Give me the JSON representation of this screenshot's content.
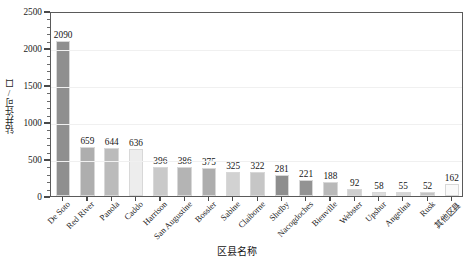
{
  "chart_data": {
    "type": "bar",
    "title": "",
    "xlabel": "区县名称",
    "ylabel": "钻井许可/口",
    "ylim": [
      0,
      2500
    ],
    "yticks": [
      0,
      500,
      1000,
      1500,
      2000,
      2500
    ],
    "grid": true,
    "legend": "none",
    "categories": [
      "De Soto",
      "Red River",
      "Panola",
      "Caddo",
      "Harrison",
      "San Augustine",
      "Bossier",
      "Sabine",
      "Claiborne",
      "Shelby",
      "Nacogdoches",
      "Bienville",
      "Webster",
      "Upshur",
      "Angelina",
      "Rusk",
      "其他区县"
    ],
    "values": [
      2090,
      659,
      644,
      636,
      396,
      386,
      375,
      325,
      322,
      281,
      221,
      188,
      92,
      58,
      55,
      52,
      162
    ],
    "bar_colors": [
      "#8f8f8f",
      "#aeaeae",
      "#bbbbbb",
      "#ededed",
      "#c9c9c9",
      "#b4b4b4",
      "#adadad",
      "#d2d2d2",
      "#c6c6c6",
      "#8e8e8e",
      "#939393",
      "#b9b9b9",
      "#cfcfcf",
      "#dcdcdc",
      "#d6d6d6",
      "#c4c4c4",
      "#fafafa"
    ]
  },
  "axis": {
    "y_tick_labels": [
      "0",
      "500",
      "1000",
      "1500",
      "2000",
      "2500"
    ],
    "x_title": "区县名称",
    "y_title": "钻井许可/口"
  }
}
